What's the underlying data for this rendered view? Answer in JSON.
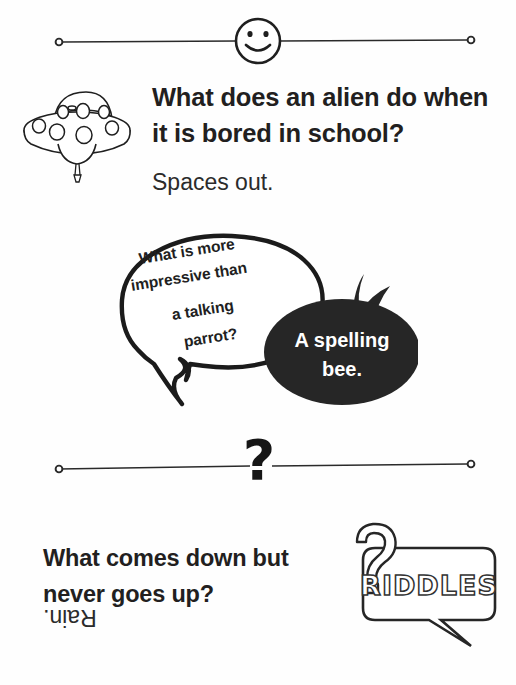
{
  "page": {
    "background_color": "#fefefe",
    "ink_color": "#221f1f"
  },
  "dividers": [
    {
      "name": "top-divider",
      "icon": "smiley-face-icon",
      "line_start_x": 58,
      "line_end_x": 472
    },
    {
      "name": "bottom-divider",
      "icon": "question-mark-icon",
      "line_start_x": 58,
      "line_end_x": 472
    }
  ],
  "jokes": [
    {
      "icon": "ufo-icon",
      "question": "What does an alien do when it is bored in school?",
      "answer": "Spaces out.",
      "answer_flipped": false
    },
    {
      "icon": "riddles-speech-bubble-icon",
      "question": "What comes down but never goes up?",
      "answer": "Rain.",
      "answer_flipped": true
    }
  ],
  "bubble_joke": {
    "question_bubble": {
      "style": "white-outline-oval",
      "fill_color": "#ffffff",
      "stroke_color": "#1b1b1b",
      "lines": [
        "What is more",
        "impressive than",
        "a talking",
        "parrot?"
      ]
    },
    "answer_bubble": {
      "style": "black-filled-oval",
      "fill_color": "#262626",
      "text_color": "#ffffff",
      "lines": [
        "A spelling",
        "bee."
      ]
    }
  },
  "riddles_logo": {
    "label": "RIDDLES",
    "icon": "question-mark-icon"
  }
}
